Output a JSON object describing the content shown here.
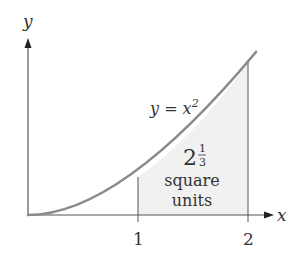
{
  "diagram": {
    "type": "area-under-curve",
    "axes": {
      "x_label": "x",
      "y_label": "y",
      "x_ticks": [
        "1",
        "2"
      ]
    },
    "curve": {
      "label_lhs": "y = x",
      "label_exp": "2",
      "function": "x^2",
      "domain": [
        0,
        2.07
      ]
    },
    "shaded_region": {
      "from": 1,
      "to": 2,
      "area_whole": "2",
      "area_num": "1",
      "area_den": "3",
      "line1": "square",
      "line2": "units"
    },
    "colors": {
      "axis": "#555555",
      "curve": "#8a8a8a",
      "shade": "#f1f1f1",
      "text": "#333333"
    }
  }
}
